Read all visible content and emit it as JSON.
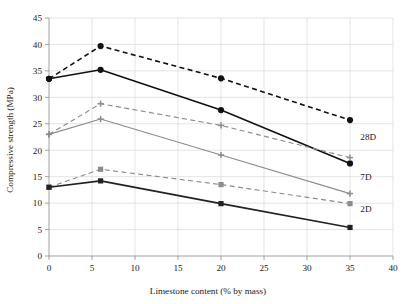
{
  "chart_data": {
    "type": "line",
    "title": "",
    "xlabel": "Limestone content (% by mass)",
    "ylabel": "Compressive strength (MPa)",
    "xlim": [
      0,
      40
    ],
    "ylim": [
      0,
      45
    ],
    "xticks": [
      0,
      5,
      10,
      15,
      20,
      25,
      30,
      35,
      40
    ],
    "xtick_labels": [
      "0",
      "5",
      "10",
      "15",
      "20",
      "25",
      "30",
      "35",
      "40"
    ],
    "yticks": [
      0,
      5,
      10,
      15,
      20,
      25,
      30,
      35,
      40,
      45
    ],
    "ytick_labels": [
      "0",
      "5",
      "10",
      "15",
      "20",
      "25",
      "30",
      "35",
      "40",
      "45"
    ],
    "grid": true,
    "legend_position": "inline-right",
    "x": [
      0,
      6,
      20,
      35
    ],
    "series": [
      {
        "name": "28D-dashed",
        "group_label": "28D",
        "values": [
          33.5,
          39.7,
          33.6,
          25.7
        ],
        "color": "#111111",
        "style": "dashed",
        "marker": "circle"
      },
      {
        "name": "28D-solid",
        "group_label": "28D",
        "values": [
          33.5,
          35.2,
          27.6,
          17.5
        ],
        "color": "#111111",
        "style": "solid",
        "marker": "circle"
      },
      {
        "name": "7D-dashed",
        "group_label": "7D",
        "values": [
          23.0,
          28.8,
          24.7,
          18.6
        ],
        "color": "#8c8c8c",
        "style": "dashed",
        "marker": "plus"
      },
      {
        "name": "7D-solid",
        "group_label": "7D",
        "values": [
          23.0,
          25.9,
          19.1,
          11.8
        ],
        "color": "#8c8c8c",
        "style": "solid",
        "marker": "plus"
      },
      {
        "name": "2D-dashed",
        "group_label": "2D",
        "values": [
          13.0,
          16.4,
          13.5,
          9.9
        ],
        "color": "#8c8c8c",
        "style": "dashed",
        "marker": "square"
      },
      {
        "name": "2D-solid",
        "group_label": "2D",
        "values": [
          13.0,
          14.2,
          9.9,
          5.4
        ],
        "color": "#222222",
        "style": "solid",
        "marker": "square"
      }
    ],
    "annotations": [
      {
        "text": "28D",
        "x": 36.2,
        "y": 22.0
      },
      {
        "text": "7D",
        "x": 36.2,
        "y": 14.3
      },
      {
        "text": "2D",
        "x": 36.2,
        "y": 8.3
      }
    ],
    "colors": {
      "dark": "#111111",
      "gray": "#8c8c8c",
      "grid": "#d8d8d8",
      "axis": "#8a8a8a",
      "background": "#ffffff"
    }
  }
}
